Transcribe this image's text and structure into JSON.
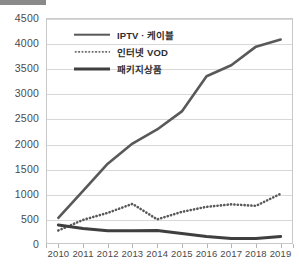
{
  "chart_data": {
    "type": "line",
    "title": "",
    "xlabel": "",
    "ylabel": "",
    "categories": [
      "2010",
      "2011",
      "2012",
      "2013",
      "2014",
      "2015",
      "2016",
      "2017",
      "2018",
      "2019"
    ],
    "ylim": [
      0,
      4500
    ],
    "yticks": [
      0,
      500,
      1000,
      1500,
      2000,
      2500,
      3000,
      3500,
      4000,
      4500
    ],
    "grid": "horizontal",
    "legend_position": "upper-left-inside",
    "series": [
      {
        "name": "IPTV · 케이블",
        "style": "solid",
        "color": "#595959",
        "values": [
          520,
          1060,
          1600,
          2000,
          2280,
          2640,
          3340,
          3560,
          3930,
          4070
        ]
      },
      {
        "name": "인터넷 VOD",
        "style": "dotted",
        "color": "#595959",
        "values": [
          270,
          480,
          620,
          800,
          490,
          640,
          740,
          790,
          760,
          1000
        ]
      },
      {
        "name": "패키지상품",
        "style": "solid",
        "color": "#3f3f3f",
        "values": [
          380,
          310,
          265,
          265,
          270,
          210,
          150,
          110,
          110,
          150
        ]
      }
    ]
  },
  "axis": {
    "y_tick_labels": [
      "4500",
      "4000",
      "3500",
      "3000",
      "2500",
      "2000",
      "1500",
      "1000",
      "500",
      "0"
    ],
    "x_tick_labels": [
      "2010",
      "2011",
      "2012",
      "2013",
      "2014",
      "2015",
      "2016",
      "2017",
      "2018",
      "2019"
    ]
  },
  "legend": {
    "items": [
      {
        "label": "IPTV · 케이블",
        "swatch": "solid-line-swatch"
      },
      {
        "label": "인터넷 VOD",
        "swatch": "dotted-line-swatch"
      },
      {
        "label": "패키지상품",
        "swatch": "solid-line-swatch"
      }
    ]
  },
  "colors": {
    "grid": "#d8d8d8",
    "frame": "#c9c9c9",
    "text": "#4a4a4a",
    "series_iptv": "#595959",
    "series_vod": "#595959",
    "series_package": "#3f3f3f"
  }
}
